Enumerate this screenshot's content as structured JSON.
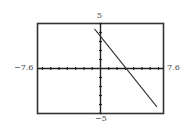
{
  "chart_data": {
    "type": "line",
    "title": "",
    "xlabel": "",
    "ylabel": "",
    "xlim": [
      -7.6,
      7.6
    ],
    "ylim": [
      -5,
      5
    ],
    "grid": false,
    "x_tick_spacing": 1,
    "y_tick_spacing": 1,
    "window_labels": {
      "xmin": "−7.6",
      "xmax": "7.6",
      "ymax": "5",
      "ymin": "−5"
    },
    "series": [
      {
        "name": "line",
        "note": "values estimated from pixel positions; exact equation not legible",
        "slope_approx": -1.15,
        "y_intercept_approx": 3.56,
        "x_intercept_approx": 3.1,
        "x": [
          -0.72,
          6.8
        ],
        "y": [
          4.4,
          -4.26
        ]
      }
    ],
    "colors": {
      "frame": "#333333",
      "axes": "#222222",
      "line": "#333333"
    }
  }
}
